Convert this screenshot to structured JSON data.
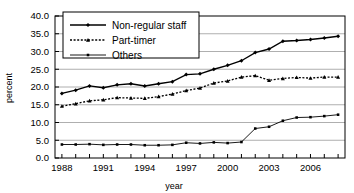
{
  "chart_data": {
    "type": "line",
    "title": "",
    "xlabel": "year",
    "ylabel": "percent",
    "xlim": [
      1987.5,
      2008.5
    ],
    "ylim": [
      0.0,
      40.0
    ],
    "grid": true,
    "grid_axis": "y",
    "legend_position": "top-left-inside",
    "y_ticks": [
      "0.0",
      "5.0",
      "10.0",
      "15.0",
      "20.0",
      "25.0",
      "30.0",
      "35.0",
      "40.0"
    ],
    "y_tick_values": [
      0.0,
      5.0,
      10.0,
      15.0,
      20.0,
      25.0,
      30.0,
      35.0,
      40.0
    ],
    "x_ticks_all": [
      1988,
      1989,
      1990,
      1991,
      1992,
      1993,
      1994,
      1995,
      1996,
      1997,
      1998,
      1999,
      2000,
      2001,
      2002,
      2003,
      2004,
      2005,
      2006,
      2007,
      2008
    ],
    "x_tick_labels": [
      "1988",
      "",
      "",
      "1991",
      "",
      "",
      "1994",
      "",
      "",
      "1997",
      "",
      "",
      "2000",
      "",
      "",
      "2003",
      "",
      "",
      "2006",
      "",
      ""
    ],
    "x": [
      1988,
      1989,
      1990,
      1991,
      1992,
      1993,
      1994,
      1995,
      1996,
      1997,
      1998,
      1999,
      2000,
      2001,
      2002,
      2003,
      2004,
      2005,
      2006,
      2007,
      2008
    ],
    "series": [
      {
        "name": "Non-regular staff",
        "style": "solid",
        "marker": "diamond",
        "color": "#000000",
        "values": [
          18.2,
          19.1,
          20.3,
          19.8,
          20.6,
          20.9,
          20.3,
          20.9,
          21.5,
          23.5,
          23.7,
          25.0,
          26.1,
          27.4,
          29.7,
          30.7,
          32.9,
          33.1,
          33.4,
          33.8,
          34.3
        ]
      },
      {
        "name": "Part-timer",
        "style": "dotted",
        "marker": "triangle",
        "color": "#000000",
        "values": [
          14.6,
          15.3,
          16.1,
          16.4,
          17.0,
          16.9,
          16.8,
          17.3,
          18.0,
          19.0,
          19.7,
          21.1,
          21.7,
          22.8,
          23.2,
          21.9,
          22.4,
          22.7,
          22.5,
          22.8,
          22.8
        ]
      },
      {
        "name": "Others",
        "style": "solid-thin",
        "marker": "square",
        "color": "#000000",
        "values": [
          3.8,
          3.8,
          3.9,
          3.7,
          3.8,
          3.8,
          3.6,
          3.6,
          3.7,
          4.3,
          4.1,
          4.4,
          4.2,
          4.5,
          8.3,
          8.8,
          10.5,
          11.4,
          11.5,
          11.8,
          12.2
        ]
      }
    ],
    "legend": [
      {
        "label": "Non-regular staff",
        "style": "solid",
        "marker": "diamond"
      },
      {
        "label": "Part-timer",
        "style": "dotted",
        "marker": "triangle"
      },
      {
        "label": "Others",
        "style": "solid-thin",
        "marker": "square"
      }
    ]
  }
}
